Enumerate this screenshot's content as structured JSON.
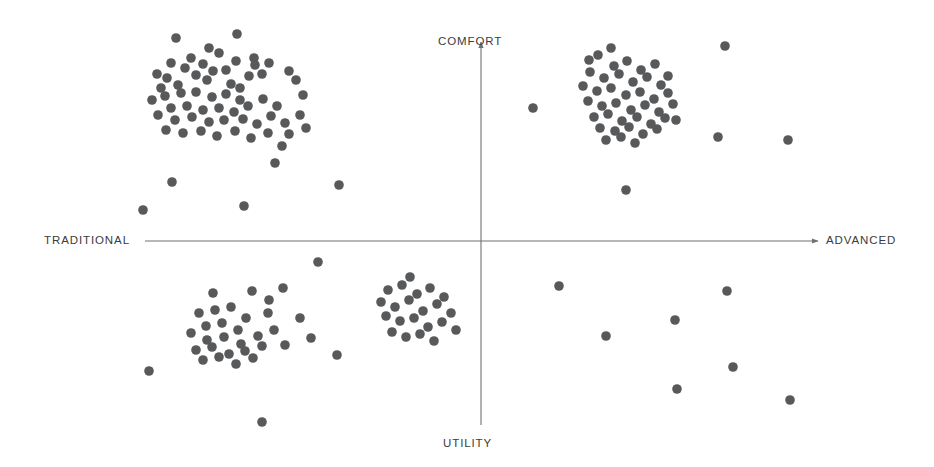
{
  "chart_data": {
    "type": "scatter",
    "title": "",
    "subtitle": "",
    "xlabel": "",
    "ylabel": "",
    "xlim": [
      0,
      934
    ],
    "ylim": [
      0,
      467
    ],
    "grid": false,
    "legend": null,
    "axes": {
      "orientation": "perceptual-map-crosshair",
      "horizontal": {
        "left_label": "TRADITIONAL",
        "right_label": "ADVANCED",
        "y": 241,
        "x_start": 145,
        "x_end": 818,
        "arrow": "right"
      },
      "vertical": {
        "top_label": "COMFORT",
        "bottom_label": "UTILITY",
        "x": 481,
        "y_start": 425,
        "y_end": 42,
        "arrow": "up"
      },
      "color": "#6f7072",
      "stroke_width": 1.1
    },
    "point_style": {
      "radius": 4.8,
      "color": "#58595b",
      "opacity": 1
    },
    "clusters": [
      {
        "name": "traditional-comfort",
        "quadrant": "upper-left",
        "count": 62,
        "center": [
          224,
          90
        ]
      },
      {
        "name": "advanced-comfort",
        "quadrant": "upper-right",
        "count": 44,
        "center": [
          622,
          96
        ]
      },
      {
        "name": "traditional-utility",
        "quadrant": "lower-left",
        "count": 31,
        "center": [
          235,
          320
        ]
      },
      {
        "name": "mid-utility",
        "quadrant": "lower-center",
        "count": 22,
        "center": [
          414,
          310
        ]
      },
      {
        "name": "advanced-utility-sparse",
        "quadrant": "lower-right",
        "count": 7,
        "center": [
          680,
          340
        ]
      }
    ],
    "points": [
      [
        176,
        38
      ],
      [
        237,
        34
      ],
      [
        209,
        48
      ],
      [
        191,
        58
      ],
      [
        219,
        53
      ],
      [
        203,
        64
      ],
      [
        236,
        61
      ],
      [
        171,
        63
      ],
      [
        254,
        58
      ],
      [
        249,
        76
      ],
      [
        262,
        74
      ],
      [
        157,
        74
      ],
      [
        185,
        68
      ],
      [
        226,
        70
      ],
      [
        167,
        78
      ],
      [
        196,
        75
      ],
      [
        213,
        71
      ],
      [
        240,
        88
      ],
      [
        231,
        84
      ],
      [
        207,
        80
      ],
      [
        178,
        85
      ],
      [
        161,
        88
      ],
      [
        255,
        65
      ],
      [
        269,
        63
      ],
      [
        289,
        71
      ],
      [
        296,
        80
      ],
      [
        303,
        95
      ],
      [
        152,
        100
      ],
      [
        165,
        96
      ],
      [
        181,
        93
      ],
      [
        196,
        92
      ],
      [
        212,
        97
      ],
      [
        226,
        94
      ],
      [
        240,
        100
      ],
      [
        171,
        108
      ],
      [
        187,
        106
      ],
      [
        203,
        110
      ],
      [
        219,
        108
      ],
      [
        234,
        112
      ],
      [
        248,
        106
      ],
      [
        263,
        99
      ],
      [
        277,
        106
      ],
      [
        158,
        115
      ],
      [
        175,
        120
      ],
      [
        192,
        117
      ],
      [
        209,
        122
      ],
      [
        224,
        120
      ],
      [
        243,
        119
      ],
      [
        257,
        124
      ],
      [
        271,
        116
      ],
      [
        285,
        123
      ],
      [
        300,
        115
      ],
      [
        166,
        130
      ],
      [
        183,
        133
      ],
      [
        201,
        131
      ],
      [
        217,
        136
      ],
      [
        235,
        131
      ],
      [
        251,
        138
      ],
      [
        268,
        133
      ],
      [
        289,
        134
      ],
      [
        306,
        128
      ],
      [
        282,
        146
      ],
      [
        275,
        163
      ],
      [
        172,
        182
      ],
      [
        244,
        206
      ],
      [
        143,
        210
      ],
      [
        339,
        185
      ],
      [
        598,
        55
      ],
      [
        614,
        66
      ],
      [
        627,
        61
      ],
      [
        641,
        70
      ],
      [
        655,
        64
      ],
      [
        590,
        72
      ],
      [
        604,
        78
      ],
      [
        619,
        74
      ],
      [
        633,
        82
      ],
      [
        647,
        77
      ],
      [
        661,
        85
      ],
      [
        583,
        86
      ],
      [
        597,
        91
      ],
      [
        611,
        88
      ],
      [
        626,
        95
      ],
      [
        640,
        92
      ],
      [
        654,
        99
      ],
      [
        668,
        93
      ],
      [
        588,
        101
      ],
      [
        602,
        106
      ],
      [
        616,
        103
      ],
      [
        631,
        110
      ],
      [
        645,
        105
      ],
      [
        659,
        112
      ],
      [
        673,
        104
      ],
      [
        594,
        117
      ],
      [
        608,
        114
      ],
      [
        622,
        121
      ],
      [
        637,
        117
      ],
      [
        651,
        124
      ],
      [
        665,
        118
      ],
      [
        600,
        128
      ],
      [
        615,
        131
      ],
      [
        629,
        127
      ],
      [
        643,
        134
      ],
      [
        657,
        129
      ],
      [
        606,
        140
      ],
      [
        621,
        137
      ],
      [
        635,
        143
      ],
      [
        611,
        48
      ],
      [
        589,
        60
      ],
      [
        668,
        76
      ],
      [
        676,
        120
      ],
      [
        533,
        108
      ],
      [
        725,
        46
      ],
      [
        718,
        137
      ],
      [
        788,
        140
      ],
      [
        626,
        190
      ],
      [
        213,
        293
      ],
      [
        252,
        291
      ],
      [
        269,
        300
      ],
      [
        283,
        288
      ],
      [
        199,
        313
      ],
      [
        215,
        310
      ],
      [
        231,
        307
      ],
      [
        246,
        318
      ],
      [
        206,
        326
      ],
      [
        222,
        323
      ],
      [
        238,
        330
      ],
      [
        191,
        333
      ],
      [
        207,
        340
      ],
      [
        224,
        337
      ],
      [
        241,
        344
      ],
      [
        258,
        336
      ],
      [
        274,
        330
      ],
      [
        268,
        313
      ],
      [
        196,
        350
      ],
      [
        212,
        347
      ],
      [
        229,
        354
      ],
      [
        245,
        351
      ],
      [
        262,
        346
      ],
      [
        203,
        360
      ],
      [
        219,
        357
      ],
      [
        236,
        364
      ],
      [
        253,
        358
      ],
      [
        285,
        345
      ],
      [
        300,
        318
      ],
      [
        311,
        338
      ],
      [
        318,
        262
      ],
      [
        149,
        371
      ],
      [
        262,
        422
      ],
      [
        337,
        355
      ],
      [
        388,
        290
      ],
      [
        402,
        285
      ],
      [
        417,
        294
      ],
      [
        430,
        288
      ],
      [
        444,
        297
      ],
      [
        381,
        302
      ],
      [
        395,
        307
      ],
      [
        409,
        300
      ],
      [
        423,
        311
      ],
      [
        437,
        304
      ],
      [
        451,
        313
      ],
      [
        386,
        316
      ],
      [
        400,
        321
      ],
      [
        414,
        318
      ],
      [
        428,
        327
      ],
      [
        442,
        322
      ],
      [
        456,
        330
      ],
      [
        392,
        332
      ],
      [
        406,
        337
      ],
      [
        420,
        334
      ],
      [
        434,
        341
      ],
      [
        410,
        277
      ],
      [
        559,
        286
      ],
      [
        727,
        291
      ],
      [
        675,
        320
      ],
      [
        606,
        336
      ],
      [
        733,
        367
      ],
      [
        677,
        389
      ],
      [
        790,
        400
      ]
    ]
  },
  "labels": {
    "comfort": "COMFORT",
    "utility": "UTILITY",
    "traditional": "TRADITIONAL",
    "advanced": "ADVANCED"
  },
  "colors": {
    "point": "#58595b",
    "axis": "#6f7072",
    "text": "#3b3b3d",
    "background": "#ffffff"
  }
}
